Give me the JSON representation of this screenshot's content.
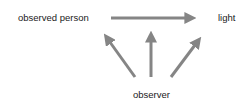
{
  "diagram": {
    "nodes": {
      "observed_person": "observed person",
      "light": "light",
      "observer": "observer"
    },
    "edges": [
      {
        "from": "observed person",
        "to": "light"
      },
      {
        "from": "observer",
        "to": "observed person"
      },
      {
        "from": "observer",
        "to": "arrow between observed person and light"
      },
      {
        "from": "observer",
        "to": "light"
      }
    ],
    "colors": {
      "arrow": "#858585",
      "text": "#1a1a1a",
      "background": "#ffffff"
    }
  }
}
